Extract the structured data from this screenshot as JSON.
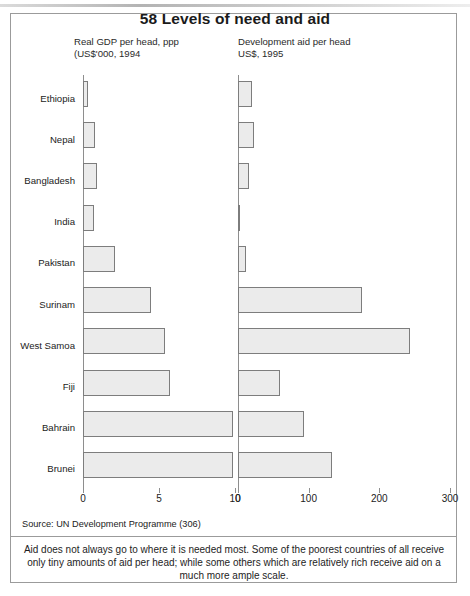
{
  "title": "58 Levels of need and aid",
  "panels": {
    "left": {
      "header": "Real GDP per head, ppp\n(US$'000, 1994",
      "ticks": [
        "0",
        "5",
        "10"
      ]
    },
    "right": {
      "header": "Development aid per head\nUS$, 1995",
      "ticks": [
        "0",
        "100",
        "200",
        "300"
      ]
    }
  },
  "countries": [
    "Ethiopia",
    "Nepal",
    "Bangladesh",
    "India",
    "Pakistan",
    "Surinam",
    "West Samoa",
    "Fiji",
    "Bahrain",
    "Brunei"
  ],
  "source": "Source: UN Development Programme (306)",
  "caption": [
    "Aid does not always go to where it is needed most. Some of the poorest countries of all receive",
    "only tiny amounts of aid per head; while some others which are relatively rich receive aid on a",
    "much more ample scale."
  ],
  "colors": {
    "bar_fill": "#ebebeb",
    "bar_border": "#7d7d7d",
    "frame": "#9b9b9b",
    "axis": "#8e8e8e",
    "text": "#1a1a1a"
  },
  "chart_data": [
    {
      "type": "bar",
      "title": "Real GDP per head, ppp (US$'000, 1994",
      "orientation": "horizontal",
      "xlabel": "US$'000",
      "ylabel": "",
      "xlim": [
        0,
        10
      ],
      "xticks": [
        0,
        5,
        10
      ],
      "grid": false,
      "legend": "none",
      "categories": [
        "Ethiopia",
        "Nepal",
        "Bangladesh",
        "India",
        "Pakistan",
        "Surinam",
        "West Samoa",
        "Fiji",
        "Bahrain",
        "Brunei"
      ],
      "values": [
        0.3,
        0.8,
        0.9,
        0.75,
        2.1,
        4.5,
        5.4,
        5.7,
        9.9,
        9.9
      ]
    },
    {
      "type": "bar",
      "title": "Development aid per head US$, 1995",
      "orientation": "horizontal",
      "xlabel": "US$",
      "ylabel": "",
      "xlim": [
        0,
        300
      ],
      "xticks": [
        0,
        100,
        200,
        300
      ],
      "grid": false,
      "legend": "none",
      "categories": [
        "Ethiopia",
        "Nepal",
        "Bangladesh",
        "India",
        "Pakistan",
        "Surinam",
        "West Samoa",
        "Fiji",
        "Bahrain",
        "Brunei"
      ],
      "values": [
        20,
        22,
        15,
        2,
        12,
        175,
        243,
        60,
        93,
        133
      ]
    }
  ]
}
